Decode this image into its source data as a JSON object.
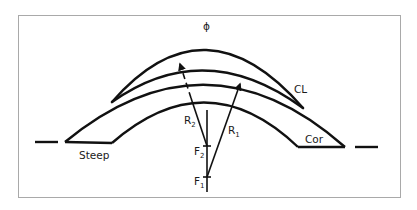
{
  "diagram": {
    "title_symbol": "ϕ",
    "labels": {
      "contact_lens": "CL",
      "cornea": "Cor",
      "steep": "Steep",
      "radius_2": "R",
      "radius_2_sub": "2",
      "radius_1": "R",
      "radius_1_sub": "1",
      "focus_2": "F",
      "focus_2_sub": "2",
      "focus_1": "F",
      "focus_1_sub": "1"
    },
    "colors": {
      "stroke": "#111111",
      "frame": "#a9a9a9",
      "background": "#ffffff"
    }
  }
}
